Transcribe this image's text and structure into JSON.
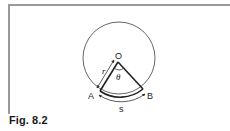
{
  "figure": {
    "caption": "Fig. 8.2",
    "labels": {
      "center": "O",
      "point_a": "A",
      "point_b": "B",
      "radius": "r",
      "angle": "θ",
      "arc_length": "s"
    },
    "colors": {
      "stroke": "#333333",
      "frame": "#9a9a9a",
      "text": "#222222"
    }
  }
}
